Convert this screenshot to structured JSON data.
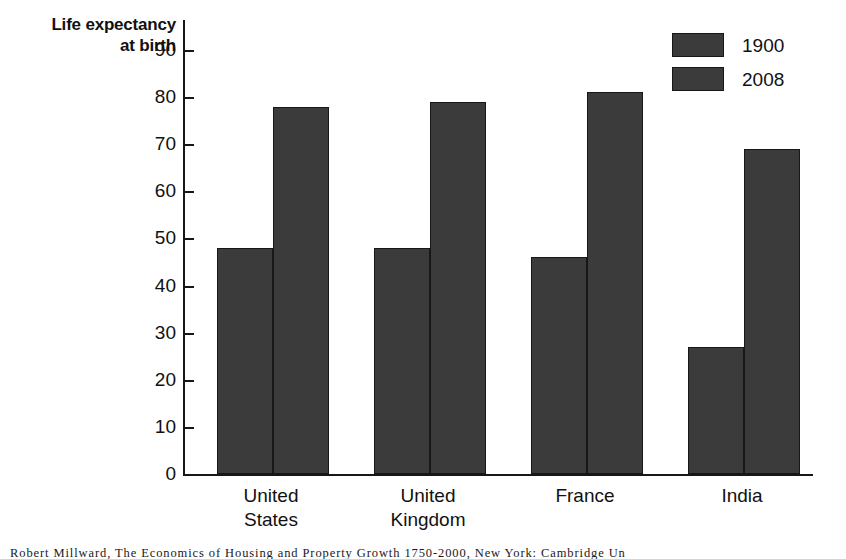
{
  "chart_data": {
    "type": "bar",
    "title": "",
    "subtitle": "",
    "ylabel": "Life expectancy\nat birth",
    "xlabel": "",
    "categories": [
      "United\nStates",
      "United\nKingdom",
      "France",
      "India"
    ],
    "series": [
      {
        "name": "1900",
        "values": [
          48,
          48,
          46,
          27
        ]
      },
      {
        "name": "2008",
        "values": [
          78,
          79,
          81,
          69
        ]
      }
    ],
    "ylim": [
      0,
      90
    ],
    "yticks": [
      0,
      10,
      20,
      30,
      40,
      50,
      60,
      70,
      80,
      90
    ],
    "ytick_labels": [
      "0",
      "10",
      "20",
      "30",
      "40",
      "50",
      "60",
      "70",
      "80",
      "90"
    ],
    "grid": false,
    "legend_position": "top-right",
    "bar_color": "#3b3b3b",
    "bar_edge_color": "#171717",
    "axis_color": "#171717",
    "background": "#ffffff"
  },
  "legend": {
    "entries": [
      {
        "label": "1900",
        "color": "#3b3b3b"
      },
      {
        "label": "2008",
        "color": "#3b3b3b"
      }
    ]
  },
  "caption": {
    "text": "Robert Millward, The Economics of Housing and Property Growth 1750-2000, New York: Cambridge Un"
  }
}
